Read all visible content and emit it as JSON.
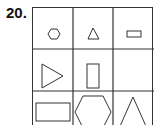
{
  "question": {
    "number": "20."
  },
  "grid": {
    "rows": 3,
    "cols": 3,
    "cells": [
      [
        "small-hexagon",
        "small-triangle",
        "small-rectangle"
      ],
      [
        "right-triangle-outline",
        "tall-rectangle",
        "empty"
      ],
      [
        "large-rectangle",
        "large-hexagon",
        "large-triangle"
      ]
    ]
  }
}
